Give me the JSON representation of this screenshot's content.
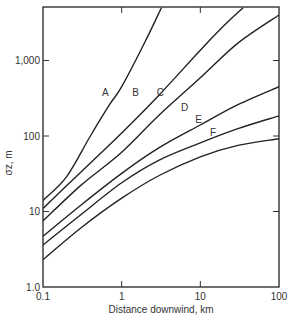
{
  "chart_data": {
    "type": "line",
    "title": "",
    "xlabel": "Distance downwind, km",
    "ylabel": "σz, m",
    "xscale": "log",
    "yscale": "log",
    "xlim": [
      0.1,
      100
    ],
    "ylim": [
      1.0,
      5000
    ],
    "grid": false,
    "legend": "inline curve labels",
    "x_ticks": [
      {
        "value": 0.1,
        "label": "0.1"
      },
      {
        "value": 1,
        "label": "1"
      },
      {
        "value": 10,
        "label": "10"
      },
      {
        "value": 100,
        "label": "100"
      }
    ],
    "y_ticks": [
      {
        "value": 1,
        "label": "1.0"
      },
      {
        "value": 10,
        "label": "10"
      },
      {
        "value": 100,
        "label": "100"
      },
      {
        "value": 1000,
        "label": "1,000"
      }
    ],
    "series": [
      {
        "name": "A",
        "label_at": [
          0.62,
          380
        ],
        "points": [
          [
            0.1,
            14
          ],
          [
            0.2,
            29
          ],
          [
            0.4,
            100
          ],
          [
            0.7,
            260
          ],
          [
            1,
            450
          ],
          [
            2,
            1800
          ],
          [
            3.2,
            5000
          ]
        ]
      },
      {
        "name": "B",
        "label_at": [
          1.5,
          380
        ],
        "points": [
          [
            0.1,
            11
          ],
          [
            0.3,
            33
          ],
          [
            1,
            110
          ],
          [
            3,
            350
          ],
          [
            10,
            1370
          ],
          [
            20,
            2900
          ],
          [
            35,
            5000
          ]
        ]
      },
      {
        "name": "C",
        "label_at": [
          3.1,
          380
        ],
        "points": [
          [
            0.1,
            7.5
          ],
          [
            0.3,
            22
          ],
          [
            1,
            61
          ],
          [
            3,
            190
          ],
          [
            10,
            590
          ],
          [
            30,
            1700
          ],
          [
            100,
            4000
          ]
        ]
      },
      {
        "name": "D",
        "label_at": [
          6.3,
          240
        ],
        "points": [
          [
            0.1,
            4.7
          ],
          [
            0.3,
            12
          ],
          [
            1,
            32
          ],
          [
            3,
            70
          ],
          [
            10,
            140
          ],
          [
            30,
            260
          ],
          [
            100,
            450
          ]
        ]
      },
      {
        "name": "E",
        "label_at": [
          9.5,
          165
        ],
        "points": [
          [
            0.1,
            3.6
          ],
          [
            0.3,
            9
          ],
          [
            1,
            24
          ],
          [
            3,
            48
          ],
          [
            10,
            81
          ],
          [
            30,
            125
          ],
          [
            100,
            185
          ]
        ]
      },
      {
        "name": "F",
        "label_at": [
          14.5,
          110
        ],
        "points": [
          [
            0.1,
            2.3
          ],
          [
            0.3,
            6
          ],
          [
            1,
            15
          ],
          [
            3,
            30
          ],
          [
            10,
            53
          ],
          [
            30,
            75
          ],
          [
            100,
            92
          ]
        ]
      }
    ]
  },
  "style": {
    "line_color": "#222222",
    "axis_color": "#333333",
    "text_color": "#333333"
  }
}
